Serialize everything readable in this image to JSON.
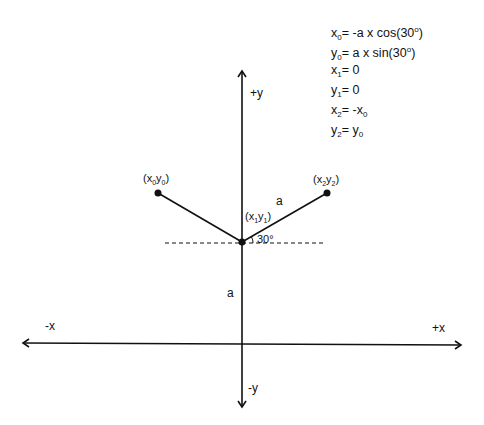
{
  "equations": [
    {
      "lhs": "x",
      "lhs_sub": "0",
      "rhs": "= -a x cos(30",
      "rhs_sup": "o",
      "rhs_tail": ")"
    },
    {
      "lhs": "y",
      "lhs_sub": "0",
      "rhs": "= a x sin(30",
      "rhs_sup": "o",
      "rhs_tail": ")"
    },
    {
      "lhs": "x",
      "lhs_sub": "1",
      "rhs": "= 0"
    },
    {
      "lhs": "y",
      "lhs_sub": "1",
      "rhs": "= 0"
    },
    {
      "lhs": "x",
      "lhs_sub": "2",
      "rhs": "= -x",
      "rhs_sub": "0"
    },
    {
      "lhs": "y",
      "lhs_sub": "2",
      "rhs": "= y",
      "rhs_sub": "0"
    }
  ],
  "axes": {
    "pos_y": "+y",
    "neg_y": "-y",
    "pos_x": "+x",
    "neg_x": "-x"
  },
  "points": {
    "p0": {
      "label_open": "(x",
      "sub_a": "0",
      "mid": "y",
      "sub_b": "0",
      "label_close": ")"
    },
    "p1": {
      "label_open": "(x",
      "sub_a": "1",
      "mid": "y",
      "sub_b": "1",
      "label_close": ")"
    },
    "p2": {
      "label_open": "(x",
      "sub_a": "2",
      "mid": "y",
      "sub_b": "2",
      "label_close": ")"
    }
  },
  "segment_labels": {
    "arm": "a",
    "vertical": "a"
  },
  "angle_label": "30°"
}
